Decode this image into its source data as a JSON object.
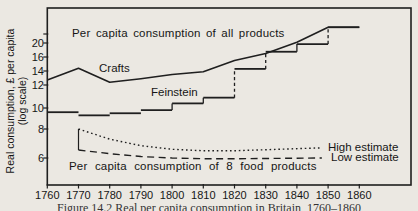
{
  "figure": {
    "caption": "Figure 14.2 Real per capita consumption in Britain, 1760–1860"
  },
  "chart_data": {
    "type": "line",
    "title": "",
    "xlabel": "",
    "ylabel": "Real consumption, £ per capita (log scale)",
    "ylabel_line1": "Real consumption, £ per capita",
    "ylabel_line2": "(log scale)",
    "x_ticks": [
      1760,
      1770,
      1780,
      1790,
      1800,
      1810,
      1820,
      1830,
      1840,
      1850,
      1860
    ],
    "y_ticks": [
      6,
      8,
      10,
      12,
      14,
      16,
      20
    ],
    "y_scale": "log",
    "grid": false,
    "legend_position": "none (direct line labels)",
    "annotations": {
      "all_products": "Per capita consumption of all products",
      "food_products": "Per capita consumption of 8 food products",
      "crafts": "Crafts",
      "feinstein": "Feinstein",
      "high": "High estimate",
      "low": "Low estimate"
    },
    "series": [
      {
        "name": "Crafts (all products)",
        "style": "solid",
        "x": [
          1760,
          1770,
          1780,
          1790,
          1800,
          1810,
          1820,
          1830,
          1840,
          1850,
          1860
        ],
        "values": [
          12.7,
          14.4,
          12.4,
          12.9,
          13.5,
          13.9,
          15.5,
          17.0,
          20.2,
          24.5,
          24.5
        ]
      },
      {
        "name": "Feinstein (all products, decade steps)",
        "style": "steps",
        "decade_start_years": [
          1760,
          1770,
          1780,
          1790,
          1800,
          1810,
          1820,
          1830,
          1840,
          1850
        ],
        "values": [
          9.6,
          9.3,
          9.5,
          9.8,
          10.4,
          10.9,
          14.3,
          17.5,
          19.7,
          24.5
        ],
        "risers": [
          {
            "year": 1800,
            "style": "solid"
          },
          {
            "year": 1810,
            "style": "solid"
          },
          {
            "year": 1820,
            "style": "dashed"
          },
          {
            "year": 1830,
            "style": "dashed"
          },
          {
            "year": 1840,
            "style": "solid"
          },
          {
            "year": 1850,
            "style": "dashed"
          }
        ]
      },
      {
        "name": "High estimate (8 food products)",
        "style": "dotted",
        "x": [
          1770,
          1780,
          1790,
          1800,
          1810,
          1820,
          1848
        ],
        "values": [
          8.0,
          7.3,
          6.85,
          6.6,
          6.5,
          6.5,
          6.7
        ]
      },
      {
        "name": "Low estimate (8 food products)",
        "style": "dashed",
        "x": [
          1770,
          1780,
          1790,
          1800,
          1810,
          1820,
          1848
        ],
        "values": [
          6.55,
          6.3,
          6.1,
          6.0,
          5.95,
          5.95,
          6.0
        ]
      }
    ],
    "food_products_start_bracket": {
      "year": 1770,
      "high": 8.0,
      "low": 6.55
    }
  }
}
